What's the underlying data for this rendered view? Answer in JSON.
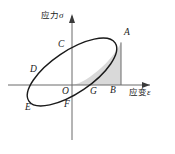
{
  "figure": {
    "type": "stress-strain-hysteresis-loop",
    "background_color": "#ffffff",
    "curve_color": "#1a1a1a",
    "axis_color": "#6b6b6b",
    "shade_color": "#d9d9d9"
  },
  "axes": {
    "y_axis": {
      "name": "stress-axis",
      "label_cn": "应力",
      "label_symbol": "σ",
      "label_full": "应力σ",
      "arrow": "up"
    },
    "x_axis": {
      "name": "strain-axis",
      "label_cn": "应变",
      "label_symbol": "ε",
      "label_full": "应变ε",
      "arrow": "right"
    },
    "origin_label": "O"
  },
  "points": [
    {
      "id": "A",
      "label": "A",
      "x": 126,
      "y": 32,
      "desc": "upper-right extreme of loop, top of vertical drop to B"
    },
    {
      "id": "C",
      "label": "C",
      "x": 60,
      "y": 44,
      "desc": "loop crossing of positive stress axis"
    },
    {
      "id": "D",
      "label": "D",
      "x": 33,
      "y": 69,
      "desc": "loop crossing of negative strain axis"
    },
    {
      "id": "E",
      "label": "E",
      "x": 28,
      "y": 106,
      "desc": "lower-left extreme of loop"
    },
    {
      "id": "F",
      "label": "F",
      "x": 66,
      "y": 103,
      "desc": "loop crossing of negative stress axis"
    },
    {
      "id": "O",
      "label": "O",
      "x": 64,
      "y": 88,
      "desc": "origin"
    },
    {
      "id": "G",
      "label": "G",
      "x": 92,
      "y": 88,
      "desc": "point on strain axis between O and B"
    },
    {
      "id": "B",
      "label": "B",
      "x": 112,
      "y": 87,
      "desc": "foot of perpendicular from A on strain axis"
    }
  ],
  "shaded_region": {
    "name": "shaded-area-OAB",
    "vertices": [
      "O",
      "A",
      "B"
    ],
    "fill": "#d9d9d9",
    "description": "Region bounded by loop arc from O to A, segment AB, and strain axis from B to O"
  }
}
